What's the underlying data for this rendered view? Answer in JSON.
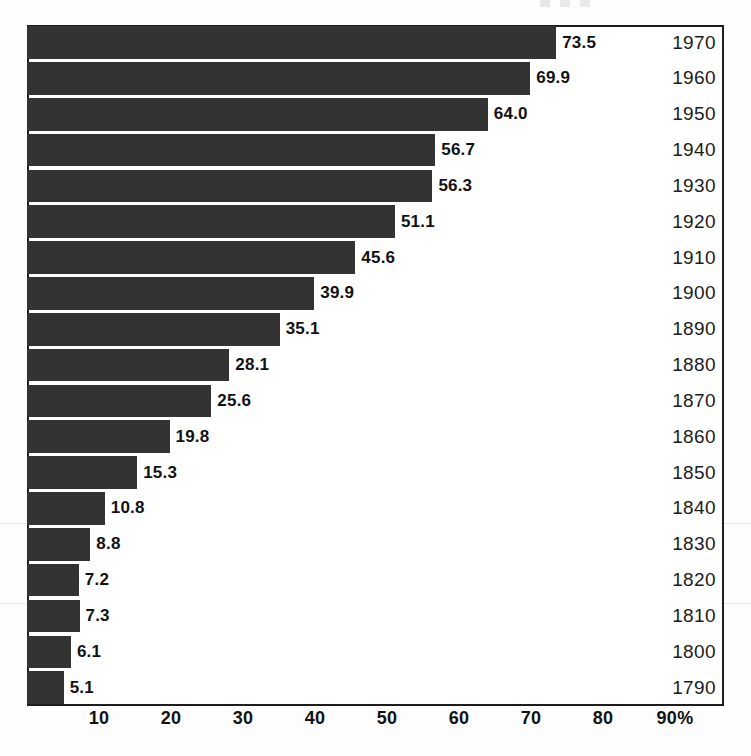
{
  "chart_data": {
    "type": "bar",
    "orientation": "horizontal",
    "title": "",
    "subtitle": "",
    "xlabel": "",
    "ylabel": "",
    "xlim": [
      0,
      96.8
    ],
    "grid": false,
    "legend": null,
    "value_label_suffix": "",
    "x_axis": {
      "tick_labels": [
        "10",
        "20",
        "30",
        "40",
        "50",
        "60",
        "70",
        "80",
        "90%"
      ],
      "tick_values": [
        10,
        20,
        30,
        40,
        50,
        60,
        70,
        80,
        90
      ],
      "unit": "%"
    },
    "categories": [
      "1970",
      "1960",
      "1950",
      "1940",
      "1930",
      "1920",
      "1910",
      "1900",
      "1890",
      "1880",
      "1870",
      "1860",
      "1850",
      "1840",
      "1830",
      "1820",
      "1810",
      "1800",
      "1790"
    ],
    "values": [
      73.5,
      69.9,
      64.0,
      56.7,
      56.3,
      51.1,
      45.6,
      39.9,
      35.1,
      28.1,
      25.6,
      19.8,
      15.3,
      10.8,
      8.8,
      7.2,
      7.3,
      6.1,
      5.1
    ],
    "value_labels": [
      "73.5",
      "69.9",
      "64.0",
      "56.7",
      "56.3",
      "51.1",
      "45.6",
      "39.9",
      "35.1",
      "28.1",
      "25.6",
      "19.8",
      "15.3",
      "10.8",
      "8.8",
      "7.2",
      "7.3",
      "6.1",
      "5.1"
    ],
    "rows": [
      {
        "year": "1970",
        "value": 73.5,
        "value_label": "73.5"
      },
      {
        "year": "1960",
        "value": 69.9,
        "value_label": "69.9"
      },
      {
        "year": "1950",
        "value": 64.0,
        "value_label": "64.0"
      },
      {
        "year": "1940",
        "value": 56.7,
        "value_label": "56.7"
      },
      {
        "year": "1930",
        "value": 56.3,
        "value_label": "56.3"
      },
      {
        "year": "1920",
        "value": 51.1,
        "value_label": "51.1"
      },
      {
        "year": "1910",
        "value": 45.6,
        "value_label": "45.6"
      },
      {
        "year": "1900",
        "value": 39.9,
        "value_label": "39.9"
      },
      {
        "year": "1890",
        "value": 35.1,
        "value_label": "35.1"
      },
      {
        "year": "1880",
        "value": 28.1,
        "value_label": "28.1"
      },
      {
        "year": "1870",
        "value": 25.6,
        "value_label": "25.6"
      },
      {
        "year": "1860",
        "value": 19.8,
        "value_label": "19.8"
      },
      {
        "year": "1850",
        "value": 15.3,
        "value_label": "15.3"
      },
      {
        "year": "1840",
        "value": 10.8,
        "value_label": "10.8"
      },
      {
        "year": "1830",
        "value": 8.8,
        "value_label": "8.8"
      },
      {
        "year": "1820",
        "value": 7.2,
        "value_label": "7.2"
      },
      {
        "year": "1810",
        "value": 7.3,
        "value_label": "7.3"
      },
      {
        "year": "1800",
        "value": 6.1,
        "value_label": "6.1"
      },
      {
        "year": "1790",
        "value": 5.1,
        "value_label": "5.1"
      }
    ]
  },
  "colors": {
    "bar": "#333333",
    "frame": "#1d1d1d",
    "text": "#121212",
    "year_text": "#1b1b1b",
    "background": "#ffffff"
  }
}
